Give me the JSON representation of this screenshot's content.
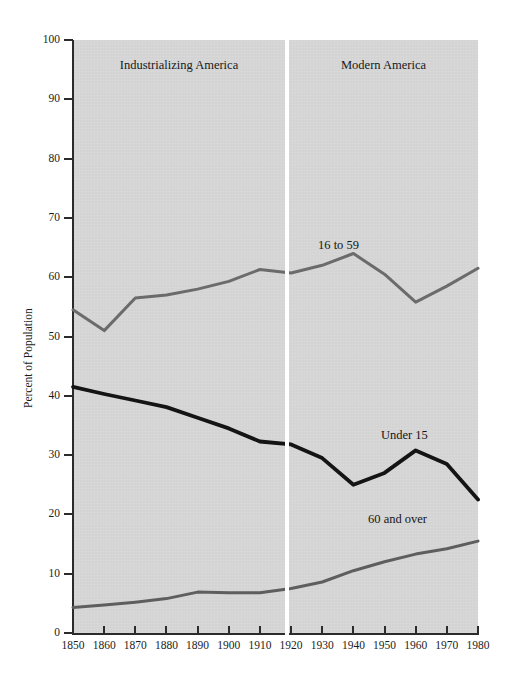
{
  "chart_data": {
    "type": "line",
    "title": "",
    "subtitle": "",
    "xlabel": "",
    "ylabel": "Percent of Population",
    "xlim": [
      1850,
      1980
    ],
    "ylim": [
      0,
      100
    ],
    "grid": false,
    "legend_position": "inline-annotations",
    "x": [
      1850,
      1860,
      1870,
      1880,
      1890,
      1900,
      1910,
      1920,
      1930,
      1940,
      1950,
      1960,
      1970,
      1980
    ],
    "xtick_labels": [
      "1850",
      "1860",
      "1870",
      "1880",
      "1890",
      "1900",
      "1910",
      "1920",
      "1930",
      "1940",
      "1950",
      "1960",
      "1970",
      "1980"
    ],
    "ytick_labels": [
      "0",
      "10",
      "20",
      "30",
      "40",
      "50",
      "60",
      "70",
      "80",
      "90",
      "100"
    ],
    "ytick_values": [
      0,
      10,
      20,
      30,
      40,
      50,
      60,
      70,
      80,
      90,
      100
    ],
    "series": [
      {
        "name": "16 to 59",
        "color": "#6b6b6b",
        "values": [
          54.5,
          51.0,
          56.5,
          57.0,
          58.0,
          59.3,
          61.3,
          60.7,
          62.0,
          64.0,
          60.5,
          55.8,
          58.5,
          61.5
        ]
      },
      {
        "name": "Under 15",
        "color": "#141414",
        "values": [
          41.5,
          40.3,
          39.2,
          38.1,
          36.3,
          34.5,
          32.3,
          31.8,
          29.5,
          25.0,
          27.0,
          30.8,
          28.5,
          22.5
        ]
      },
      {
        "name": "60 and over",
        "color": "#5e5e5e",
        "values": [
          4.3,
          4.7,
          5.2,
          5.8,
          6.9,
          6.8,
          6.8,
          7.5,
          8.6,
          10.5,
          12.0,
          13.3,
          14.2,
          15.5
        ]
      }
    ],
    "annotations": [
      {
        "text": "16 to 59",
        "x": 1940,
        "y": 66
      },
      {
        "text": "Under 15",
        "x": 1960,
        "y": 34
      },
      {
        "text": "60 and over",
        "x": 1958,
        "y": 20
      }
    ],
    "era_bands": [
      {
        "label": "Industrializing America",
        "start": 1850,
        "end": 1920
      },
      {
        "label": "Modern America",
        "start": 1920,
        "end": 1980
      }
    ],
    "colors": {
      "plot_background": "#d6d6d6",
      "page_background": "#ffffff",
      "axis": "#2b2b2b",
      "divider": "#ffffff"
    }
  }
}
